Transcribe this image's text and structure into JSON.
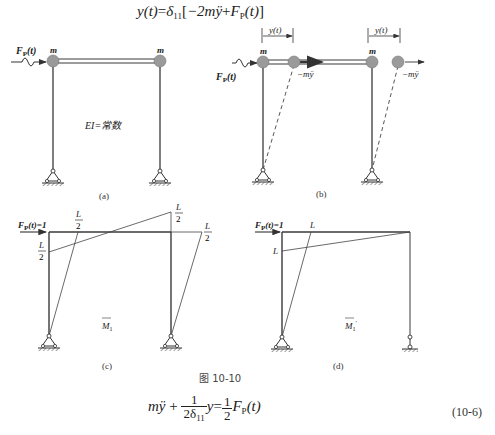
{
  "equations": {
    "top": {
      "lhs": "y(t)",
      "equals": "=",
      "delta": "δ",
      "delta_sub": "11",
      "bracket_open": "[",
      "minus_2m": "−2m",
      "yddot": "ÿ",
      "plus": "+",
      "force": "F",
      "force_sub": "P",
      "force_arg": "(t)",
      "bracket_close": "]"
    },
    "bottom": {
      "m": "m",
      "yddot": "ÿ",
      "plus": "+",
      "frac1_num": "1",
      "frac1_den": "2δ",
      "frac1_den_sub": "11",
      "y": "y",
      "equals": "=",
      "frac2_num": "1",
      "frac2_den": "2",
      "force": "F",
      "force_sub": "P",
      "force_arg": "(t)",
      "number": "(10-6)"
    }
  },
  "figure": {
    "caption": "图 10-10",
    "panels": {
      "a": {
        "label": "(a)",
        "force_label": "F",
        "force_sub": "P",
        "force_arg": "(t)",
        "mass_left": "m",
        "mass_right": "m",
        "stiffness_label": "EI=常数"
      },
      "b": {
        "label": "(b)",
        "force_label": "F",
        "force_sub": "P",
        "force_arg": "(t)",
        "mass_left": "m",
        "mass_right": "m",
        "disp_left": "y(t)",
        "disp_right": "y(t)",
        "inertia_left": "−mÿ",
        "inertia_right": "−mÿ"
      },
      "c": {
        "label": "(c)",
        "force_label": "F",
        "force_sub": "P",
        "force_arg": "(t)=1",
        "moment_label": "M",
        "moment_sub": "1",
        "ordinates": [
          "L/2",
          "L/2",
          "L/2",
          "L/2"
        ],
        "ord_num": "L",
        "ord_den": "2"
      },
      "d": {
        "label": "(d)",
        "force_label": "F",
        "force_sub": "P",
        "force_arg": "(t)=1",
        "moment_label": "M",
        "moment_sub": "1",
        "moment_prime": "′",
        "ordinate_top": "L",
        "ordinate_left": "L"
      }
    }
  },
  "colors": {
    "line": "#3a3a3a",
    "mass_fill": "#9a9a9a",
    "text": "#222222"
  }
}
